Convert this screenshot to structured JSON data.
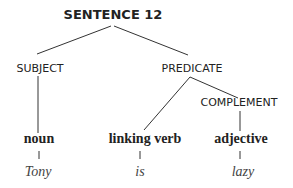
{
  "diagram": {
    "title": "SENTENCE 12",
    "nodes": {
      "subject": "SUBJECT",
      "predicate": "PREDICATE",
      "complement": "COMPLEMENT"
    },
    "parts_of_speech": [
      {
        "label": "noun",
        "word": "Tony"
      },
      {
        "label": "linking verb",
        "word": "is"
      },
      {
        "label": "adjective",
        "word": "lazy"
      }
    ]
  }
}
